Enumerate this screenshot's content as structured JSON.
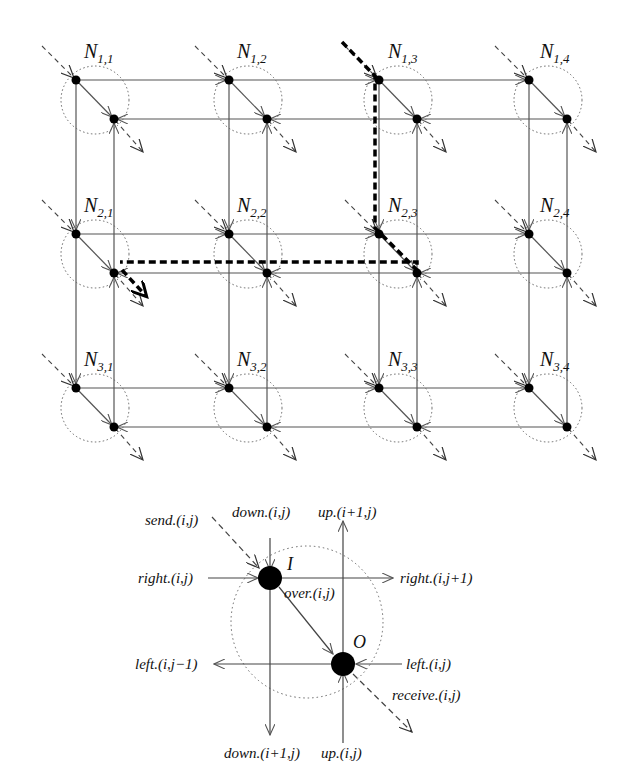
{
  "grid": {
    "rows": 3,
    "cols": 4,
    "node_labels": [
      [
        "N",
        "1,1",
        "1,2",
        "1,3",
        "1,4"
      ],
      [
        "N",
        "2,1",
        "2,2",
        "2,3",
        "2,4"
      ],
      [
        "N",
        "3,1",
        "3,2",
        "3,3",
        "3,4"
      ]
    ],
    "nodes": [
      {
        "name": "N",
        "sub": "1,1"
      },
      {
        "name": "N",
        "sub": "1,2"
      },
      {
        "name": "N",
        "sub": "1,3"
      },
      {
        "name": "N",
        "sub": "1,4"
      },
      {
        "name": "N",
        "sub": "2,1"
      },
      {
        "name": "N",
        "sub": "2,2"
      },
      {
        "name": "N",
        "sub": "2,3"
      },
      {
        "name": "N",
        "sub": "2,4"
      },
      {
        "name": "N",
        "sub": "3,1"
      },
      {
        "name": "N",
        "sub": "3,2"
      },
      {
        "name": "N",
        "sub": "3,3"
      },
      {
        "name": "N",
        "sub": "3,4"
      }
    ],
    "highlighted_path": "N1,3 → N2,3 → N2,1 (bold dashed route)"
  },
  "detail": {
    "input_node": "I",
    "output_node": "O",
    "labels": {
      "send": "send.(i,j)",
      "down_in": "down.(i,j)",
      "up_out": "up.(i+1,j)",
      "right_in": "right.(i,j)",
      "right_out": "right.(i,j+1)",
      "over": "over.(i,j)",
      "left_out": "left.(i,j−1)",
      "left_in": "left.(i,j)",
      "receive": "receive.(i,j)",
      "down_out": "down.(i+1,j)",
      "up_in": "up.(i,j)"
    }
  }
}
